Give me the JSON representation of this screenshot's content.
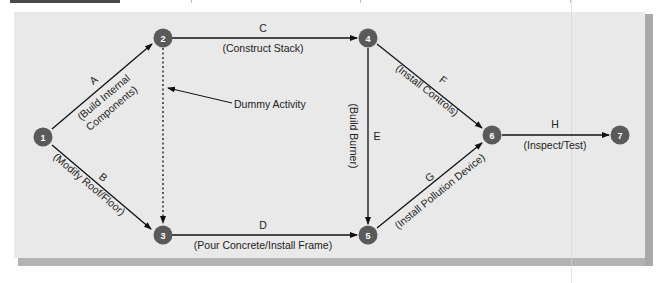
{
  "diagram": {
    "type": "activity-on-arrow network",
    "colors": {
      "panel": "#e9e9e9",
      "node": "#5a5a5a",
      "node_text": "#ffffff",
      "arrow": "#111111",
      "shadow": "#b0b0b0"
    },
    "nodes": [
      {
        "id": "1",
        "label": "1"
      },
      {
        "id": "2",
        "label": "2"
      },
      {
        "id": "3",
        "label": "3"
      },
      {
        "id": "4",
        "label": "4"
      },
      {
        "id": "5",
        "label": "5"
      },
      {
        "id": "6",
        "label": "6"
      },
      {
        "id": "7",
        "label": "7"
      }
    ],
    "activities": [
      {
        "from": "1",
        "to": "2",
        "letter": "A",
        "desc": "(Build Internal",
        "desc2": "Components)"
      },
      {
        "from": "1",
        "to": "3",
        "letter": "B",
        "desc": "(Modify Roof/Floor)"
      },
      {
        "from": "2",
        "to": "4",
        "letter": "C",
        "desc": "(Construct Stack)"
      },
      {
        "from": "3",
        "to": "5",
        "letter": "D",
        "desc": "(Pour Concrete/Install Frame)"
      },
      {
        "from": "4",
        "to": "5",
        "letter": "E",
        "desc": "(Build Burner)"
      },
      {
        "from": "4",
        "to": "6",
        "letter": "F",
        "desc": "(Install Controls)"
      },
      {
        "from": "5",
        "to": "6",
        "letter": "G",
        "desc": "(Install Pollution Device)"
      },
      {
        "from": "6",
        "to": "7",
        "letter": "H",
        "desc": "(Inspect/Test)"
      }
    ],
    "dummy": {
      "from": "2",
      "to": "3",
      "label": "Dummy Activity"
    }
  }
}
